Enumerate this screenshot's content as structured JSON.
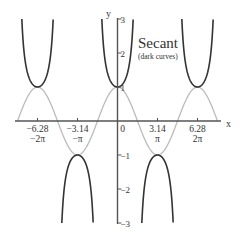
{
  "chart_data": {
    "type": "line",
    "title": "Secant",
    "subtitle": "(dark curves)",
    "xlabel": "x",
    "ylabel": "y",
    "xlim": [
      -7.9,
      7.9
    ],
    "ylim": [
      -3,
      3
    ],
    "grid": false,
    "x_ticks": [
      {
        "value": -6.28,
        "label": "-6.28",
        "pi_label": "-2π"
      },
      {
        "value": -3.14,
        "label": "-3.14",
        "pi_label": "-π"
      },
      {
        "value": 0,
        "label": "0",
        "pi_label": ""
      },
      {
        "value": 3.14,
        "label": "3.14",
        "pi_label": "π"
      },
      {
        "value": 6.28,
        "label": "6.28",
        "pi_label": "2π"
      }
    ],
    "y_ticks": [
      {
        "value": 3,
        "label": "3"
      },
      {
        "value": 2,
        "label": "2"
      },
      {
        "value": 1,
        "label": "1"
      },
      {
        "value": -1,
        "label": "-1"
      },
      {
        "value": -2,
        "label": "-2"
      },
      {
        "value": -3,
        "label": "-3"
      }
    ],
    "series": [
      {
        "name": "sec(x)",
        "style": "dark",
        "color": "#333333",
        "function": "1/cos(x)",
        "branches": [
          [
            -7.8,
            -4.76
          ],
          [
            -4.3,
            -1.99
          ],
          [
            -1.25,
            1.25
          ],
          [
            1.99,
            4.3
          ],
          [
            4.76,
            7.8
          ]
        ]
      },
      {
        "name": "cos(x)",
        "style": "light",
        "color": "#bbbbbb",
        "function": "cos(x)",
        "domain": [
          -7.85,
          7.85
        ]
      }
    ]
  },
  "labels": {
    "title": "Secant",
    "subtitle": "(dark curves)",
    "x_axis": "x",
    "y_axis": "y"
  }
}
